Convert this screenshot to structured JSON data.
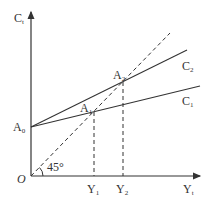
{
  "diagram": {
    "y_axis": {
      "label": "C",
      "sub": "t"
    },
    "x_axis": {
      "label": "Y",
      "sub": "t"
    },
    "origin": "O",
    "intercept": {
      "label": "A",
      "sub": "0"
    },
    "points": [
      {
        "label": "A",
        "sub": "1"
      },
      {
        "label": "A",
        "sub": "2"
      }
    ],
    "curves": [
      {
        "label": "C",
        "sub": "1"
      },
      {
        "label": "C",
        "sub": "2"
      }
    ],
    "x_ticks": [
      {
        "label": "Y",
        "sub": "1"
      },
      {
        "label": "Y",
        "sub": "2"
      }
    ],
    "angle_label": "45°",
    "line_color": "#333333"
  }
}
